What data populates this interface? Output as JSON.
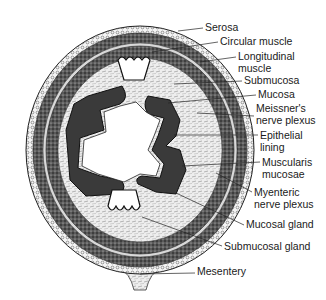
{
  "diagram": {
    "labels": [
      {
        "id": "serosa",
        "lines": [
          "Serosa"
        ],
        "x": 205,
        "y": 22,
        "target": [
          178,
          31
        ]
      },
      {
        "id": "circular-muscle",
        "lines": [
          "Circular muscle"
        ],
        "x": 220,
        "y": 36,
        "target": [
          152,
          52
        ]
      },
      {
        "id": "longitudinal-muscle",
        "lines": [
          "Longitudinal",
          "muscle"
        ],
        "x": 238,
        "y": 51,
        "target": [
          200,
          62
        ]
      },
      {
        "id": "submucosa",
        "lines": [
          "Submucosa"
        ],
        "x": 244,
        "y": 75,
        "target": [
          174,
          84
        ]
      },
      {
        "id": "mucosa",
        "lines": [
          "Mucosa"
        ],
        "x": 258,
        "y": 89,
        "target": [
          168,
          103
        ]
      },
      {
        "id": "meissners-nerve-plexus",
        "lines": [
          "Meissner's",
          "nerve plexus"
        ],
        "x": 256,
        "y": 103,
        "target": [
          197,
          113
        ]
      },
      {
        "id": "epithelial-lining",
        "lines": [
          "Epithelial",
          "lining"
        ],
        "x": 260,
        "y": 130,
        "target": [
          174,
          135
        ]
      },
      {
        "id": "muscularis-mucosae",
        "lines": [
          "Muscularis",
          "mucosae"
        ],
        "x": 262,
        "y": 157,
        "target": [
          182,
          166
        ]
      },
      {
        "id": "myenteric-nerve-plexus",
        "lines": [
          "Myenteric",
          "nerve plexus"
        ],
        "x": 254,
        "y": 187,
        "target": [
          216,
          173
        ]
      },
      {
        "id": "mucosal-gland",
        "lines": [
          "Mucosal gland"
        ],
        "x": 246,
        "y": 219,
        "target": [
          176,
          193
        ]
      },
      {
        "id": "submucosal-gland",
        "lines": [
          "Submucosal gland"
        ],
        "x": 224,
        "y": 241,
        "target": [
          142,
          217
        ]
      },
      {
        "id": "mesentery",
        "lines": [
          "Mesentery"
        ],
        "x": 197,
        "y": 266,
        "target": [
          140,
          274
        ]
      }
    ]
  }
}
